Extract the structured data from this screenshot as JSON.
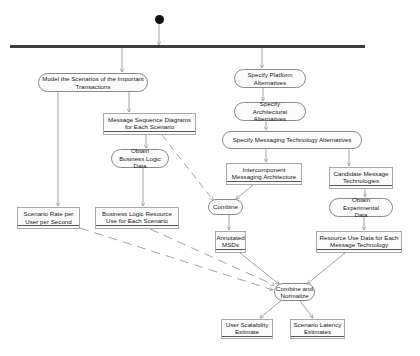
{
  "diagram": {
    "type": "UML activity diagram",
    "start": {
      "cx": 159,
      "cy": 19
    },
    "fork": {
      "x1": 10,
      "x2": 365,
      "y": 46
    },
    "nodes": {
      "model_scenarios": {
        "label": "Model the Scenarios of the Important Transactions",
        "kind": "activity",
        "x": 38,
        "y": 73,
        "w": 110,
        "h": 19
      },
      "specify_platform": {
        "label": "Specify Platform Alternatives",
        "kind": "activity",
        "x": 234,
        "y": 69,
        "w": 72,
        "h": 19
      },
      "specify_architectural": {
        "label": "Specify Architectural Alternatives",
        "kind": "activity",
        "x": 234,
        "y": 102,
        "w": 72,
        "h": 19
      },
      "specify_messaging": {
        "label": "Specify Messaging Technology Alternatives",
        "kind": "activity",
        "x": 222,
        "y": 131,
        "w": 140,
        "h": 18
      },
      "message_sequence": {
        "label": "Message Sequence Diagrams for Each Scenario",
        "kind": "object",
        "x": 103,
        "y": 113,
        "w": 93,
        "h": 22
      },
      "obtain_business": {
        "label": "Obtain Business Logic Data",
        "kind": "activity",
        "x": 111,
        "y": 149,
        "w": 58,
        "h": 19
      },
      "intercomponent": {
        "label": "Intercomponent Messaging Architecture",
        "kind": "object",
        "x": 226,
        "y": 163,
        "w": 76,
        "h": 22
      },
      "candidate_tech": {
        "label": "Candidate Message Technologies",
        "kind": "object",
        "x": 329,
        "y": 167,
        "w": 64,
        "h": 22
      },
      "combine": {
        "label": "Combine",
        "kind": "activity",
        "x": 208,
        "y": 199,
        "w": 35,
        "h": 16
      },
      "obtain_experimental": {
        "label": "Obtain Experimental Data",
        "kind": "activity",
        "x": 329,
        "y": 198,
        "w": 64,
        "h": 19
      },
      "scenario_rate": {
        "label": "Scenario Rate per User per Second",
        "kind": "object",
        "x": 17,
        "y": 207,
        "w": 63,
        "h": 22
      },
      "business_resource": {
        "label": "Business Logic Resource Use for Each Scenario",
        "kind": "object",
        "x": 95,
        "y": 207,
        "w": 84,
        "h": 22
      },
      "annotated_msds": {
        "label": "Annotated MSDs",
        "kind": "object",
        "x": 215,
        "y": 231,
        "w": 31,
        "h": 22
      },
      "resource_use_tech": {
        "label": "Resource Use Data for Each Message Technology",
        "kind": "object",
        "x": 316,
        "y": 231,
        "w": 86,
        "h": 22
      },
      "combine_normalize": {
        "label": "Combine and Normalize",
        "kind": "activity",
        "x": 274,
        "y": 283,
        "w": 41,
        "h": 18
      },
      "user_scalability": {
        "label": "User Scalability Estimate",
        "kind": "object",
        "x": 221,
        "y": 319,
        "w": 52,
        "h": 20
      },
      "scenario_latency": {
        "label": "Scenario Latency Estimates",
        "kind": "object",
        "x": 290,
        "y": 319,
        "w": 55,
        "h": 20
      }
    },
    "edges": [
      {
        "from": "start",
        "to": "fork",
        "style": "solid"
      },
      {
        "from": "fork",
        "to": "model_scenarios",
        "style": "solid"
      },
      {
        "from": "fork",
        "to": "specify_platform",
        "style": "solid"
      },
      {
        "from": "specify_platform",
        "to": "specify_architectural",
        "style": "solid"
      },
      {
        "from": "specify_architectural",
        "to": "specify_messaging",
        "style": "solid"
      },
      {
        "from": "model_scenarios",
        "to": "message_sequence",
        "style": "solid"
      },
      {
        "from": "model_scenarios",
        "to": "scenario_rate",
        "style": "solid"
      },
      {
        "from": "message_sequence",
        "to": "obtain_business",
        "style": "solid"
      },
      {
        "from": "obtain_business",
        "to": "business_resource",
        "style": "solid"
      },
      {
        "from": "message_sequence",
        "to": "combine",
        "style": "dashed"
      },
      {
        "from": "specify_messaging",
        "to": "intercomponent",
        "style": "solid"
      },
      {
        "from": "specify_messaging",
        "to": "candidate_tech",
        "style": "solid"
      },
      {
        "from": "intercomponent",
        "to": "combine",
        "style": "solid"
      },
      {
        "from": "combine",
        "to": "annotated_msds",
        "style": "solid"
      },
      {
        "from": "candidate_tech",
        "to": "obtain_experimental",
        "style": "solid"
      },
      {
        "from": "obtain_experimental",
        "to": "resource_use_tech",
        "style": "solid"
      },
      {
        "from": "scenario_rate",
        "to": "combine_normalize",
        "style": "dashed"
      },
      {
        "from": "business_resource",
        "to": "combine_normalize",
        "style": "dashed"
      },
      {
        "from": "annotated_msds",
        "to": "combine_normalize",
        "style": "solid"
      },
      {
        "from": "resource_use_tech",
        "to": "combine_normalize",
        "style": "solid"
      },
      {
        "from": "combine_normalize",
        "to": "user_scalability",
        "style": "solid"
      },
      {
        "from": "combine_normalize",
        "to": "scenario_latency",
        "style": "solid"
      }
    ],
    "colors": {
      "line": "#8c8c8c",
      "bar": "#3c3c3c",
      "dot": "#111111",
      "box_border": "#a8a8a8"
    }
  }
}
